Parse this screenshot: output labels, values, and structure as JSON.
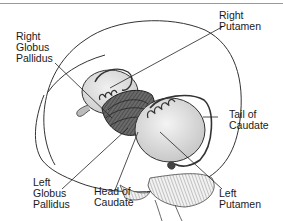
{
  "diagram": {
    "labels": {
      "right_globus_pallidus": "Right\nGlobus\nPallidus",
      "right_putamen": "Right\nPutamen",
      "tail_of_caudate": "Tail of\nCaudate",
      "left_putamen": "Left\nPutamen",
      "head_of_caudate": "Head of\nCaudate",
      "left_globus_pallidus": "Left\nGlobus\nPallidus"
    },
    "colors": {
      "line": "#2a2a2a",
      "shade_dark": "#5a5a5a",
      "shade_light": "#d8d8d8",
      "background": "#ffffff"
    }
  }
}
